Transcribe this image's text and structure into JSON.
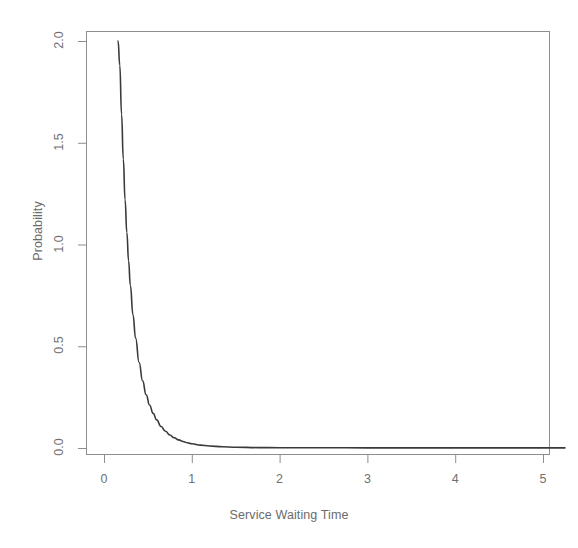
{
  "chart_data": {
    "type": "line",
    "title": "",
    "xlabel": "Service Waiting Time",
    "ylabel": "Probability",
    "xlim": [
      0,
      5.25
    ],
    "ylim": [
      0,
      2.1
    ],
    "xticks": [
      0,
      1,
      2,
      3,
      4,
      5
    ],
    "xticklabels": [
      "0",
      "1",
      "2",
      "3",
      "4",
      "5"
    ],
    "yticks": [
      0.0,
      0.5,
      1.0,
      1.5,
      2.0
    ],
    "yticklabels": [
      "0.0",
      "0.5",
      "1.0",
      "1.5",
      "2.0"
    ],
    "grid": false,
    "legend": null,
    "box": true,
    "line_color": "#3a3a3a",
    "line_width": 1.6,
    "series": [
      {
        "name": "Probability density",
        "x": [
          0.16,
          0.18,
          0.2,
          0.22,
          0.24,
          0.26,
          0.28,
          0.3,
          0.33,
          0.36,
          0.4,
          0.44,
          0.48,
          0.52,
          0.56,
          0.6,
          0.65,
          0.7,
          0.75,
          0.8,
          0.85,
          0.9,
          0.95,
          1.0,
          1.1,
          1.2,
          1.35,
          1.5,
          1.75,
          2.0,
          2.5,
          3.0,
          3.5,
          4.0,
          4.5,
          5.0,
          5.25
        ],
        "y": [
          2.1,
          1.88,
          1.64,
          1.42,
          1.22,
          1.06,
          0.92,
          0.8,
          0.655,
          0.54,
          0.42,
          0.33,
          0.262,
          0.21,
          0.17,
          0.138,
          0.106,
          0.082,
          0.064,
          0.05,
          0.04,
          0.032,
          0.026,
          0.021,
          0.014,
          0.01,
          0.006,
          0.004,
          0.002,
          0.0015,
          0.001,
          0.0008,
          0.0006,
          0.0005,
          0.0004,
          0.0004,
          0.0004
        ]
      }
    ]
  },
  "axes": {
    "y_title": "Probability",
    "x_title": "Service Waiting Time"
  }
}
